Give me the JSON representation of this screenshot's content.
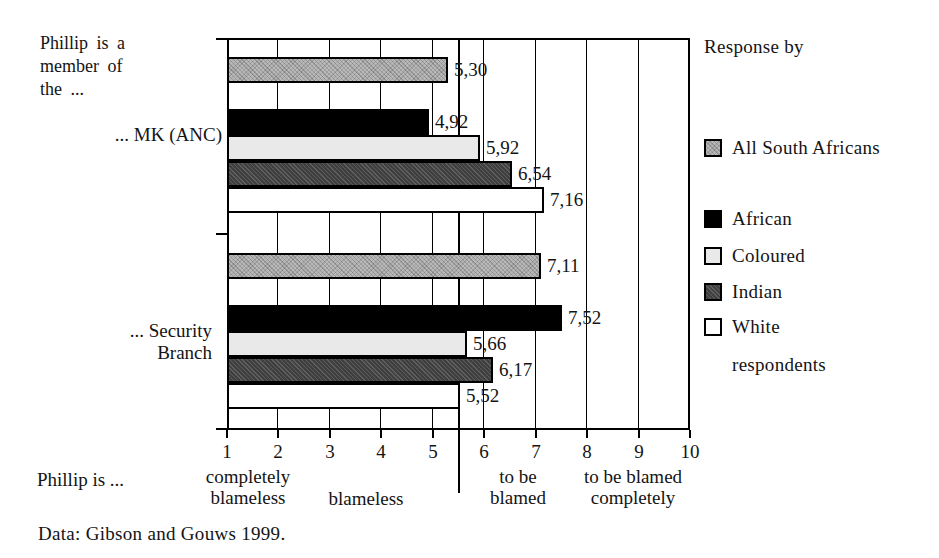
{
  "left_note": "Phillip is a\nmember of\nthe ...",
  "category_labels": [
    "... MK (ANC)",
    "... Security\nBranch"
  ],
  "bottom": {
    "lead_in": "Phillip is ..."
  },
  "source": "Data: Gibson and Gouws 1999.",
  "legend": {
    "title": "Response by",
    "footer": "respondents"
  },
  "chart_data": {
    "type": "bar",
    "orientation": "horizontal",
    "title": "",
    "categories": [
      "... MK (ANC)",
      "... Security Branch"
    ],
    "series": [
      {
        "name": "All South Africans",
        "values": [
          5.3,
          7.11
        ],
        "value_labels": [
          "5,30",
          "7,11"
        ],
        "color": "#b9b9b9",
        "pattern": "hatch-light"
      },
      {
        "name": "African",
        "values": [
          4.92,
          7.52
        ],
        "value_labels": [
          "4,92",
          "7,52"
        ],
        "color": "#000000",
        "pattern": null
      },
      {
        "name": "Coloured",
        "values": [
          5.92,
          5.66
        ],
        "value_labels": [
          "5,92",
          "5,66"
        ],
        "color": "#e9e9e9",
        "pattern": null
      },
      {
        "name": "Indian",
        "values": [
          6.54,
          6.17
        ],
        "value_labels": [
          "6,54",
          "6,17"
        ],
        "color": "#3f3f3f",
        "pattern": "hatch-dark"
      },
      {
        "name": "White",
        "values": [
          7.16,
          5.52
        ],
        "value_labels": [
          "7,16",
          "5,52"
        ],
        "color": "#ffffff",
        "pattern": null
      }
    ],
    "axis": {
      "min": 1,
      "max": 10,
      "ticks": [
        1,
        2,
        3,
        4,
        5,
        6,
        7,
        8,
        9,
        10
      ],
      "reference_line": 5.5
    },
    "scale_annotations": [
      {
        "text": "completely\nblameless",
        "at": 1.4
      },
      {
        "text": "blameless",
        "at": 3.7
      },
      {
        "text": "to be\nblamed",
        "at": 6.65
      },
      {
        "text": "to be blamed\ncompletely",
        "at": 8.9
      }
    ],
    "grid": "vertical-only",
    "legend_position": "right",
    "bar_colors": {
      "all_south_africans": "#b9b9b9",
      "african": "#000000",
      "coloured": "#e9e9e9",
      "indian": "#3f3f3f",
      "white": "#ffffff"
    }
  }
}
